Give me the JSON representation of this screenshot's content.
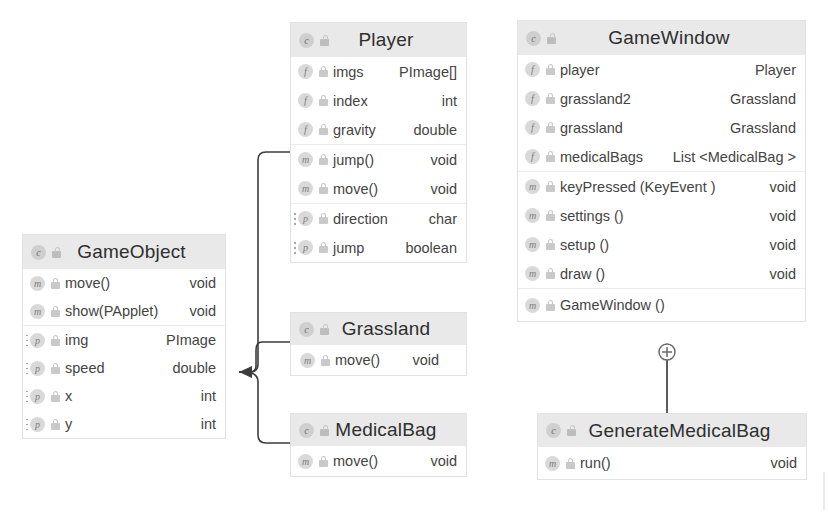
{
  "diagram": {
    "type": "uml-class-diagram",
    "palette": {
      "header_bg": "#e9e9e9",
      "box_bg": "#ffffff",
      "border": "#e2e2e2",
      "text": "#3a3a3a",
      "icon_bg": "#d9d9d9",
      "connector": "#3d3d3d"
    },
    "classes": [
      {
        "id": "gameobject",
        "name": "GameObject",
        "icon": "class-icon",
        "visibility_icon": "lock-icon",
        "groups": [
          {
            "kind": "methods",
            "members": [
              {
                "icon": "method-icon",
                "lock": "lock-icon",
                "name": "move()",
                "type": "void"
              },
              {
                "icon": "method-icon",
                "lock": "lock-icon",
                "name": "show(PApplet)",
                "type": "void"
              }
            ]
          },
          {
            "kind": "properties",
            "members": [
              {
                "icon": "property-icon",
                "lock": "lock-icon",
                "name": "img",
                "type": "PImage"
              },
              {
                "icon": "property-icon",
                "lock": "lock-icon",
                "name": "speed",
                "type": "double"
              },
              {
                "icon": "property-icon",
                "lock": "lock-icon",
                "name": "x",
                "type": "int"
              },
              {
                "icon": "property-icon",
                "lock": "lock-icon",
                "name": "y",
                "type": "int"
              }
            ]
          }
        ]
      },
      {
        "id": "player",
        "name": "Player",
        "icon": "class-icon",
        "visibility_icon": "lock-icon",
        "groups": [
          {
            "kind": "fields",
            "members": [
              {
                "icon": "field-icon",
                "lock": "lock-icon",
                "name": "imgs",
                "type": "PImage[]"
              },
              {
                "icon": "field-icon",
                "lock": "lock-icon",
                "name": "index",
                "type": "int"
              },
              {
                "icon": "field-icon",
                "lock": "lock-icon",
                "name": "gravity",
                "type": "double"
              }
            ]
          },
          {
            "kind": "methods",
            "members": [
              {
                "icon": "method-icon",
                "lock": "lock-icon",
                "name": "jump()",
                "type": "void"
              },
              {
                "icon": "method-icon",
                "lock": "lock-icon",
                "name": "move()",
                "type": "void"
              }
            ]
          },
          {
            "kind": "properties",
            "members": [
              {
                "icon": "property-icon",
                "lock": "lock-icon",
                "name": "direction",
                "type": "char"
              },
              {
                "icon": "property-icon",
                "lock": "lock-icon",
                "name": "jump",
                "type": "boolean"
              }
            ]
          }
        ]
      },
      {
        "id": "grassland",
        "name": "Grassland",
        "icon": "class-icon",
        "visibility_icon": "lock-icon",
        "groups": [
          {
            "kind": "methods",
            "members": [
              {
                "icon": "method-icon",
                "lock": "lock-icon",
                "name": "move()",
                "type": "void"
              }
            ]
          }
        ]
      },
      {
        "id": "medicalbag",
        "name": "MedicalBag",
        "icon": "class-icon",
        "visibility_icon": "lock-icon",
        "groups": [
          {
            "kind": "methods",
            "members": [
              {
                "icon": "method-icon",
                "lock": "lock-icon",
                "name": "move()",
                "type": "void"
              }
            ]
          }
        ]
      },
      {
        "id": "gamewindow",
        "name": "GameWindow",
        "icon": "class-icon",
        "visibility_icon": "lock-icon",
        "groups": [
          {
            "kind": "fields",
            "members": [
              {
                "icon": "field-icon",
                "lock": "lock-icon",
                "name": "player",
                "type": "Player"
              },
              {
                "icon": "field-icon",
                "lock": "lock-icon",
                "name": "grassland2",
                "type": "Grassland"
              },
              {
                "icon": "field-icon",
                "lock": "lock-icon",
                "name": "grassland",
                "type": "Grassland"
              },
              {
                "icon": "field-icon",
                "lock": "lock-icon",
                "name": "medicalBags",
                "type": "List <MedicalBag >"
              }
            ]
          },
          {
            "kind": "methods",
            "members": [
              {
                "icon": "method-icon",
                "lock": "lock-icon",
                "name": "keyPressed (KeyEvent )",
                "type": "void",
                "bold_params": true
              },
              {
                "icon": "method-icon",
                "lock": "lock-icon",
                "name": "settings ()",
                "type": "void",
                "bold_params": true
              },
              {
                "icon": "method-icon",
                "lock": "lock-icon",
                "name": "setup ()",
                "type": "void",
                "bold_params": true
              },
              {
                "icon": "method-icon",
                "lock": "lock-icon",
                "name": "draw ()",
                "type": "void",
                "bold_params": true
              }
            ]
          },
          {
            "kind": "constructor",
            "members": [
              {
                "icon": "method-icon",
                "lock": "lock-icon",
                "name": "GameWindow ()",
                "type": ""
              }
            ]
          }
        ]
      },
      {
        "id": "generatemedicalbag",
        "name": "GenerateMedicalBag",
        "icon": "class-icon",
        "visibility_icon": "lock-icon",
        "groups": [
          {
            "kind": "methods",
            "members": [
              {
                "icon": "method-icon",
                "lock": "lock-icon",
                "name": "run()",
                "type": "void"
              }
            ]
          }
        ]
      }
    ],
    "connectors": [
      {
        "id": "player-to-gameobject",
        "from": "player",
        "to": "gameobject",
        "kind": "generalization",
        "arrow": "solid-triangle"
      },
      {
        "id": "grassland-to-gameobject",
        "from": "grassland",
        "to": "gameobject",
        "kind": "generalization",
        "arrow": "solid-triangle"
      },
      {
        "id": "medicalbag-to-gameobject",
        "from": "medicalbag",
        "to": "gameobject",
        "kind": "generalization",
        "arrow": "solid-triangle"
      },
      {
        "id": "gamewindow-to-generatemedicalbag",
        "from": "gamewindow",
        "to": "generatemedicalbag",
        "kind": "nested-class",
        "arrow": "circled-plus"
      }
    ]
  }
}
